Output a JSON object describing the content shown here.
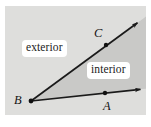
{
  "figure": {
    "kind": "geometry-angle-diagram",
    "width": 151,
    "height": 127,
    "background_color": "#ffffff",
    "plane_fill_color": "#dededc",
    "interior_fill_color": "#c9c9c7",
    "line_color": "#1a1a1a",
    "label_box_color": "#ffffff",
    "text_color": "#151515"
  },
  "region_labels": {
    "exterior": "exterior",
    "interior": "interior"
  },
  "points": [
    {
      "name": "B",
      "label": "B",
      "role": "vertex",
      "x": 31,
      "y": 101
    },
    {
      "name": "A",
      "label": "A",
      "role": "ray-point",
      "x": 105,
      "y": 93
    },
    {
      "name": "C",
      "label": "C",
      "role": "ray-point",
      "x": 106,
      "y": 45
    }
  ],
  "rays": [
    {
      "name": "ray-BA",
      "from": "B",
      "through": "A",
      "tip_x": 143,
      "tip_y": 89
    },
    {
      "name": "ray-BC",
      "from": "C",
      "through": "C",
      "tip_x": 140,
      "tip_y": 21
    }
  ]
}
